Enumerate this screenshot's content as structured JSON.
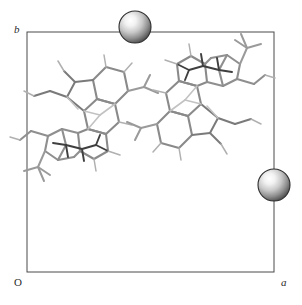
{
  "figure": {
    "type": "crystal-packing-diagram",
    "title": "",
    "width": 302,
    "height": 305,
    "background_color": "#ffffff"
  },
  "axes": {
    "b_label": "b",
    "a_label": "a",
    "origin_label": "O",
    "frame_color": "#4a4a4a",
    "frame_width": 1
  },
  "unit_cell": {
    "x0": 27,
    "y0": 32,
    "x1": 274,
    "y1": 272,
    "shape": "square"
  },
  "spheres": [
    {
      "name": "sphere-top-edge",
      "cx": 135,
      "cy": 27,
      "r": 16,
      "edge": "b-axis-top",
      "fill_light": "#fdfdfd",
      "fill_mid": "#a9a9a9",
      "fill_dark": "#2e2e2e"
    },
    {
      "name": "sphere-right-edge",
      "cx": 274,
      "cy": 185,
      "r": 16,
      "edge": "a-axis-right",
      "fill_light": "#fdfdfd",
      "fill_mid": "#a9a9a9",
      "fill_dark": "#2e2e2e"
    }
  ],
  "molecules": [
    {
      "name": "molecule-left",
      "center_x": 78,
      "center_y": 105,
      "rotation": 0,
      "bond_color": "#8c8c8c",
      "bond_dark": "#3d3d3d",
      "description": "fused polycyclic wireframe molecule, upper-left quadrant"
    },
    {
      "name": "molecule-right",
      "center_x": 207,
      "center_y": 110,
      "rotation": 180,
      "bond_color": "#8c8c8c",
      "bond_dark": "#3d3d3d",
      "description": "symmetry-related copy of molecule-left, upper-right quadrant"
    }
  ],
  "colors": {
    "frame": "#4a4a4a",
    "bond_light": "#a6a6a6",
    "bond_mid": "#858585",
    "bond_dark": "#3d3d3d",
    "text": "#2b2b2b",
    "background": "#ffffff"
  }
}
